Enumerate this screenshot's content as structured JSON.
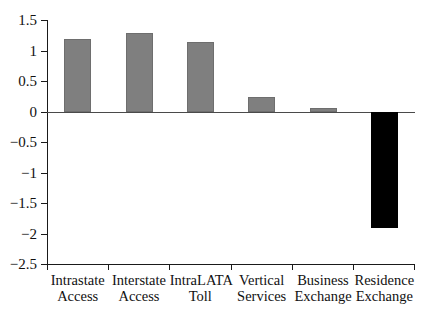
{
  "chart_data": {
    "type": "bar",
    "title": "",
    "subtitle": "",
    "xlabel": "",
    "ylabel": "",
    "categories": [
      "Intrastate Access",
      "Interstate Access",
      "IntraLATA Toll",
      "Vertical Services",
      "Business Exchange",
      "Residence Exchange"
    ],
    "category_lines": [
      [
        "Intrastate",
        "Access"
      ],
      [
        "Interstate",
        "Access"
      ],
      [
        "IntraLATA",
        "Toll"
      ],
      [
        "Vertical",
        "Services"
      ],
      [
        "Business",
        "Exchange"
      ],
      [
        "Residence",
        "Exchange"
      ]
    ],
    "values": [
      1.2,
      1.3,
      1.14,
      0.24,
      0.07,
      -1.9
    ],
    "bar_colors": [
      "#7f7f7f",
      "#7f7f7f",
      "#7f7f7f",
      "#7f7f7f",
      "#7f7f7f",
      "#000000"
    ],
    "ylim": [
      -2.5,
      1.5
    ],
    "yticks": [
      1.5,
      1,
      0.5,
      0,
      -0.5,
      -1,
      -1.5,
      -2,
      -2.5
    ],
    "ytick_labels": [
      "1.5",
      "1",
      "0.5",
      "0",
      "−0.5",
      "−1",
      "−1.5",
      "−2",
      "−2.5"
    ],
    "grid": false,
    "legend": null,
    "legend_position": "none",
    "zero_line": true,
    "annotations": []
  },
  "colors": {
    "positive_bar": "#7f7f7f",
    "negative_bar": "#000000",
    "axis": "#1a1a1a",
    "zero_line": "#4a4a4a",
    "background": "#ffffff",
    "text": "#111111"
  }
}
